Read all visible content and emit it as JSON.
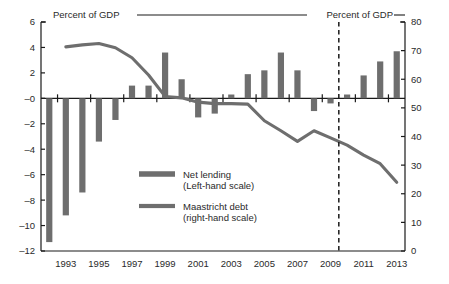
{
  "chart_data": {
    "type": "bar",
    "title": "",
    "subtitle": "",
    "xlabel": "",
    "ylabel": "Percent of GDP",
    "ylabel_right": "Percent of GDP",
    "grid": false,
    "legend_position": "center",
    "x": [
      1992,
      1993,
      1994,
      1995,
      1996,
      1997,
      1998,
      1999,
      2000,
      2001,
      2002,
      2003,
      2004,
      2005,
      2006,
      2007,
      2008,
      2009,
      2010,
      2011,
      2012,
      2013
    ],
    "xtick_labels": [
      "1993",
      "1995",
      "1997",
      "1999",
      "2001",
      "2003",
      "2005",
      "2007",
      "2009",
      "2011",
      "2013"
    ],
    "xtick_values": [
      1993,
      1995,
      1997,
      1999,
      2001,
      2003,
      2005,
      2007,
      2009,
      2011,
      2013
    ],
    "ylim": [
      -12,
      6
    ],
    "ytick_labels": [
      "6",
      "4",
      "2",
      "–0",
      "–2",
      "–4",
      "–6",
      "–8",
      "–10",
      "–12"
    ],
    "ytick_values": [
      6,
      4,
      2,
      0,
      -2,
      -4,
      -6,
      -8,
      -10,
      -12
    ],
    "ylim_right": [
      0,
      80
    ],
    "ytick_labels_right": [
      "80",
      "70",
      "60",
      "50",
      "40",
      "30",
      "20",
      "10",
      "0"
    ],
    "ytick_values_right": [
      80,
      70,
      60,
      50,
      40,
      30,
      20,
      10,
      0
    ],
    "series": [
      {
        "name": "Net lending",
        "scale": "left",
        "kind": "bar",
        "legend_label": "Net lending",
        "legend_sublabel": "(Left-hand scale)",
        "color": "#6e6e6e",
        "values": [
          -11.3,
          -9.2,
          -7.4,
          -3.4,
          -1.7,
          1.0,
          1.0,
          3.6,
          1.5,
          -1.5,
          -1.2,
          0.3,
          1.9,
          2.2,
          3.6,
          2.2,
          -1.0,
          -0.4,
          0.3,
          1.8,
          2.9,
          3.7
        ]
      },
      {
        "name": "Maastricht debt",
        "scale": "right",
        "kind": "line",
        "legend_label": "Maastricht debt",
        "legend_sublabel": "(right-hand scale)",
        "color": "#6e6e6e",
        "x": [
          1993,
          1994,
          1995,
          1996,
          1997,
          1998,
          1999,
          2000,
          2001,
          2002,
          2003,
          2004,
          2005,
          2006,
          2007,
          2008,
          2009,
          2010,
          2011,
          2012,
          2013
        ],
        "values": [
          71.3,
          72.0,
          72.5,
          71.0,
          67.5,
          61.5,
          54.0,
          53.5,
          52.0,
          51.5,
          51.5,
          51.3,
          45.5,
          42.0,
          38.3,
          42.0,
          39.5,
          37.0,
          33.5,
          30.5,
          24.0
        ]
      }
    ],
    "annotations": [
      {
        "name": "forecast-divider",
        "type": "vertical-dashed-line",
        "x": 2009.5,
        "label": ""
      }
    ]
  },
  "axis": {
    "left_caption": "Percent of GDP",
    "right_caption": "Percent of GDP"
  }
}
